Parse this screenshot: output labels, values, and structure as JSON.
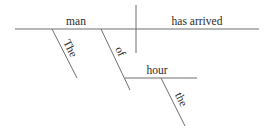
{
  "diagram": {
    "type": "sentence-diagram",
    "sentence": "The man of the hour has arrived",
    "line_color": "#6e6e6e",
    "text_color": "#2a2a2a",
    "baseline": {
      "x1": 15,
      "y1": 29,
      "x2": 259,
      "y2": 29
    },
    "subject_predicate_divider": {
      "x1": 136,
      "y1": 5,
      "x2": 136,
      "y2": 53
    },
    "subject": {
      "text": "man",
      "x": 76,
      "y": 25
    },
    "predicate": {
      "text": "has arrived",
      "x": 197,
      "y": 25
    },
    "modifiers": [
      {
        "role": "article",
        "text": "The",
        "line": {
          "x1": 52,
          "y1": 29,
          "x2": 77,
          "y2": 78
        },
        "label": {
          "x": 67,
          "y": 50
        }
      },
      {
        "role": "preposition",
        "text": "of",
        "line": {
          "x1": 101,
          "y1": 29,
          "x2": 130,
          "y2": 90
        },
        "label": {
          "x": 117,
          "y": 53
        }
      }
    ],
    "prepositional_object": {
      "text": "hour",
      "line": {
        "x1": 125,
        "y1": 78,
        "x2": 197,
        "y2": 78
      },
      "label": {
        "x": 157,
        "y": 74
      }
    },
    "object_modifiers": [
      {
        "role": "article",
        "text": "the",
        "line": {
          "x1": 161,
          "y1": 78,
          "x2": 185,
          "y2": 126
        },
        "label": {
          "x": 178,
          "y": 101
        }
      }
    ]
  }
}
